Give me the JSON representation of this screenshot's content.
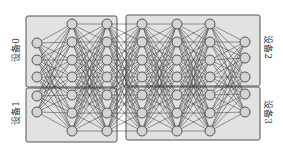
{
  "diagram": {
    "title": "",
    "colors": {
      "box_fill": "#e2e2e2",
      "box_stroke": "#555555",
      "node_fill": "#d4d4d4",
      "node_stroke": "#555555",
      "edge": "#3a3a3a"
    },
    "devices": [
      {
        "id": "device-0",
        "label": "设备0",
        "box": [
          26,
          16,
          91,
          71
        ],
        "label_pos": [
          15,
          50
        ],
        "side": "left"
      },
      {
        "id": "device-1",
        "label": "设备1",
        "box": [
          26,
          88,
          91,
          54
        ],
        "label_pos": [
          15,
          113
        ],
        "side": "left"
      },
      {
        "id": "device-2",
        "label": "设备2",
        "box": [
          126,
          15,
          134,
          71
        ],
        "label_pos": [
          268,
          47
        ],
        "side": "right"
      },
      {
        "id": "device-3",
        "label": "设备3",
        "box": [
          126,
          87,
          134,
          53
        ],
        "label_pos": [
          268,
          112
        ],
        "side": "right"
      }
    ],
    "layers": [
      {
        "x": 37,
        "nodes": [
          43,
          60,
          77,
          96,
          112
        ]
      },
      {
        "x": 72,
        "nodes": [
          24,
          42,
          60,
          77,
          95,
          113,
          131
        ]
      },
      {
        "x": 107,
        "nodes": [
          24,
          42,
          60,
          77,
          95,
          113,
          131
        ]
      },
      {
        "x": 142,
        "nodes": [
          24,
          42,
          60,
          77,
          95,
          113,
          131
        ]
      },
      {
        "x": 177,
        "nodes": [
          24,
          42,
          60,
          77,
          95,
          113,
          131
        ]
      },
      {
        "x": 210,
        "nodes": [
          24,
          42,
          60,
          77,
          95,
          113,
          131
        ]
      },
      {
        "x": 245,
        "nodes": [
          42,
          58,
          77,
          94,
          112
        ]
      }
    ],
    "node_radius": 5,
    "connectivity": "fully-connected between adjacent layers"
  }
}
